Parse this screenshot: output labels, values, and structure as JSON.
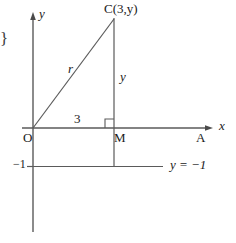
{
  "figure": {
    "background_color": "#ffffff",
    "line_color": "#5a5a5a",
    "text_color": "#1a1a1a",
    "width": 236,
    "height": 243
  },
  "axes": {
    "x_axis_label": "x",
    "y_axis_label": "y",
    "origin_label": "O",
    "x_axis_y_px": 128,
    "y_axis_x_px": 33
  },
  "points": {
    "c_label": "C(3,y)",
    "m_label": "M",
    "a_label": "A",
    "o_label": "O"
  },
  "segments": {
    "hypotenuse_label": "r",
    "vertical_label": "y",
    "base_label": "3"
  },
  "horizontal_line": {
    "axis_tick_label": "−1",
    "equation_label": "y = −1"
  },
  "markers": {
    "right_angle": "right-angle-square"
  },
  "artifact": {
    "left_edge_brace": "}"
  }
}
